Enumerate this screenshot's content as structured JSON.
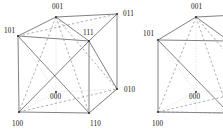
{
  "figure": {
    "title": "",
    "background_color": "#ffffff",
    "stroke_color": "#4a4a4a",
    "dashed_color": "#8c8c8c",
    "dotted_color": "#b8b8b8",
    "label_color": "#111111",
    "panels": [
      {
        "name": "left-cube-with-inscribed-tetrahedron",
        "labels": [
          {
            "text": "001",
            "x": 52,
            "y": 9
          },
          {
            "text": "011",
            "x": 123,
            "y": 16
          },
          {
            "text": "101",
            "x": 4,
            "y": 33
          },
          {
            "text": "111",
            "x": 83,
            "y": 35
          },
          {
            "text": "010",
            "x": 124,
            "y": 92
          },
          {
            "text": "000",
            "x": 50,
            "y": 99
          },
          {
            "text": "100",
            "x": 12,
            "y": 126
          },
          {
            "text": "110",
            "x": 90,
            "y": 126
          }
        ],
        "vertices": {
          "001": [
            56,
            17
          ],
          "011": [
            117,
            14
          ],
          "101": [
            18,
            36
          ],
          "111": [
            89,
            41
          ],
          "010": [
            117,
            89
          ],
          "000": [
            56,
            92
          ],
          "100": [
            19,
            112
          ],
          "110": [
            89,
            113
          ]
        }
      },
      {
        "name": "right-cube-with-inscribed-tetrahedron",
        "labels": [
          {
            "text": "001",
            "x": 191,
            "y": 9
          },
          {
            "text": "101",
            "x": 143,
            "y": 36
          },
          {
            "text": "000",
            "x": 189,
            "y": 99
          },
          {
            "text": "100",
            "x": 152,
            "y": 126
          }
        ],
        "vertices": {
          "001": [
            196,
            17
          ],
          "011": [
            257,
            14
          ],
          "101": [
            158,
            40
          ],
          "111": [
            229,
            41
          ],
          "010": [
            257,
            89
          ],
          "000": [
            196,
            92
          ],
          "100": [
            158,
            112
          ],
          "110": [
            229,
            113
          ]
        }
      }
    ],
    "vertex_codes": [
      "000",
      "001",
      "010",
      "011",
      "100",
      "101",
      "110",
      "111"
    ],
    "tetrahedron_vertices": [
      "001",
      "010",
      "100",
      "111"
    ]
  }
}
